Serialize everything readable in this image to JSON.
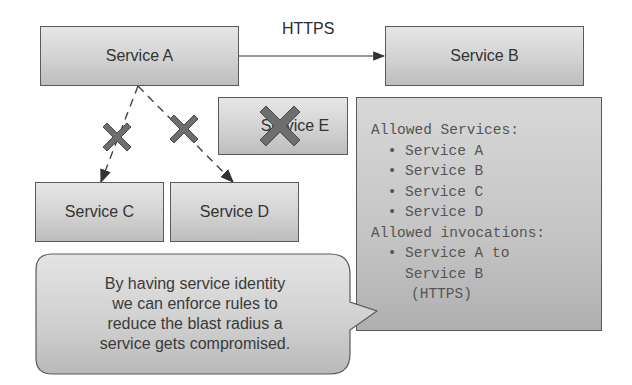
{
  "diagram": {
    "connection_label": "HTTPS",
    "services": {
      "a": {
        "label": "Service A"
      },
      "b": {
        "label": "Service B"
      },
      "c": {
        "label": "Service C"
      },
      "d": {
        "label": "Service D"
      },
      "e": {
        "label": "Service E",
        "blocked": true
      }
    },
    "edges": [
      {
        "from": "Service A",
        "to": "Service B",
        "style": "solid",
        "label": "HTTPS",
        "allowed": true
      },
      {
        "from": "Service A",
        "to": "Service C",
        "style": "dashed",
        "allowed": false
      },
      {
        "from": "Service A",
        "to": "Service D",
        "style": "dashed",
        "allowed": false
      }
    ],
    "policy": {
      "allowed_services_heading": "Allowed Services:",
      "allowed_services": [
        "Service A",
        "Service B",
        "Service C",
        "Service D"
      ],
      "allowed_invocations_heading": "Allowed invocations:",
      "invocation_line1": "Service A to",
      "invocation_line2": "Service B",
      "invocation_line3": "(HTTPS)"
    },
    "callout": {
      "lines": [
        "By having service identity",
        "we can enforce rules to",
        "reduce the blast radius a",
        "service gets compromised."
      ]
    },
    "colors": {
      "box_border": "#5a5a5a",
      "x_mark": "#6e6e6e",
      "x_mark_border": "#4a4a4a",
      "text": "#333333"
    }
  }
}
